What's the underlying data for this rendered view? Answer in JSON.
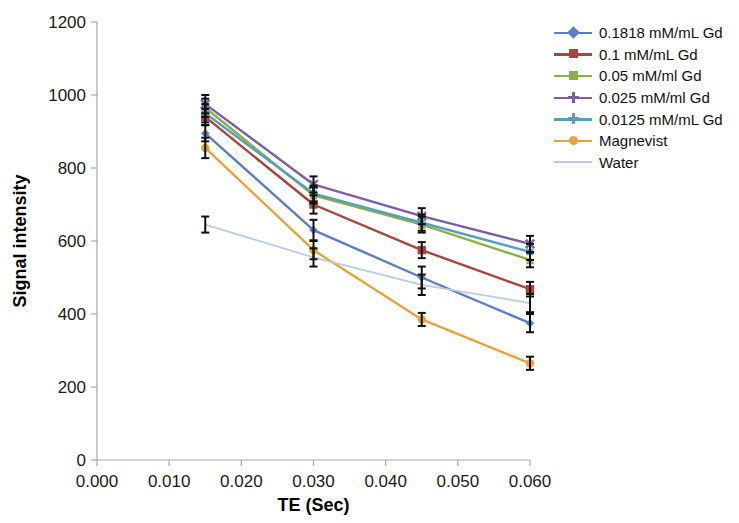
{
  "chart_data": {
    "type": "line",
    "title": "",
    "xlabel": "TE (Sec)",
    "ylabel": "Signal intensity",
    "x": [
      0.015,
      0.03,
      0.045,
      0.06
    ],
    "xlim": [
      0.0,
      0.06
    ],
    "ylim": [
      0,
      1200
    ],
    "xticks": [
      "0.000",
      "0.010",
      "0.020",
      "0.030",
      "0.040",
      "0.050",
      "0.060"
    ],
    "xtick_values": [
      0.0,
      0.01,
      0.02,
      0.03,
      0.04,
      0.05,
      0.06
    ],
    "yticks": [
      "0",
      "200",
      "400",
      "600",
      "800",
      "1000",
      "1200"
    ],
    "ytick_values": [
      0,
      200,
      400,
      600,
      800,
      1000,
      1200
    ],
    "grid": false,
    "legend_position": "right",
    "error_bars": true,
    "series": [
      {
        "name": "0.1818 mM/mL Gd",
        "color": "#5b7fc4",
        "marker": "diamond",
        "values": [
          895,
          630,
          500,
          375
        ],
        "errors": [
          22,
          28,
          30,
          25
        ]
      },
      {
        "name": "0.1 mM/mL Gd",
        "color": "#a8453e",
        "marker": "square",
        "values": [
          940,
          700,
          575,
          468
        ],
        "errors": [
          22,
          25,
          22,
          20
        ]
      },
      {
        "name": "0.05 mM/ml Gd",
        "color": "#8bb14a",
        "marker": "triangle",
        "values": [
          965,
          725,
          645,
          548
        ],
        "errors": [
          25,
          22,
          22,
          20
        ]
      },
      {
        "name": "0.025 mM/ml Gd",
        "color": "#7b5ea7",
        "marker": "cross",
        "values": [
          975,
          755,
          668,
          592
        ],
        "errors": [
          25,
          22,
          22,
          22
        ]
      },
      {
        "name": "0.0125 mM/mL Gd",
        "color": "#56a0b8",
        "marker": "asterisk",
        "values": [
          950,
          730,
          650,
          570
        ],
        "errors": [
          25,
          22,
          22,
          22
        ]
      },
      {
        "name": "Magnevist",
        "color": "#e8a33d",
        "marker": "circle",
        "values": [
          855,
          575,
          385,
          265
        ],
        "errors": [
          28,
          25,
          18,
          18
        ]
      },
      {
        "name": "Water",
        "color": "#b8cce8",
        "marker": "line",
        "values": [
          645,
          555,
          480,
          430
        ],
        "errors": [
          22,
          25,
          28,
          25
        ]
      }
    ]
  },
  "legend": {
    "items": [
      {
        "label": "0.1818 mM/mL Gd",
        "color": "#5b7fc4",
        "marker": "diamond"
      },
      {
        "label": "0.1 mM/mL Gd",
        "color": "#a8453e",
        "marker": "square"
      },
      {
        "label": "0.05 mM/ml Gd",
        "color": "#8bb14a",
        "marker": "triangle"
      },
      {
        "label": "0.025 mM/ml Gd",
        "color": "#7b5ea7",
        "marker": "cross"
      },
      {
        "label": "0.0125 mM/mL Gd",
        "color": "#56a0b8",
        "marker": "asterisk"
      },
      {
        "label": "Magnevist",
        "color": "#e8a33d",
        "marker": "circle"
      },
      {
        "label": "Water",
        "color": "#b8cce8",
        "marker": "line"
      }
    ]
  }
}
